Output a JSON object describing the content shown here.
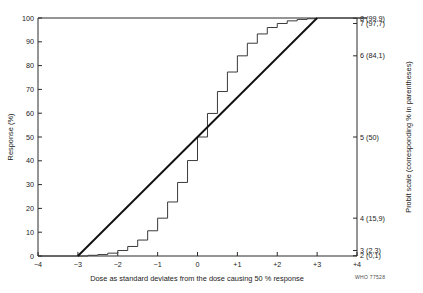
{
  "chart_data": {
    "type": "line",
    "title": "",
    "xlabel": "Dose as standard deviates from the dose causing 50 % response",
    "ylabel": "Response (%)",
    "y2label": "Probit scale (corresponding % in parentheses)",
    "xlim": [
      -4,
      4
    ],
    "ylim": [
      0,
      100
    ],
    "grid": false,
    "legend": "none",
    "credit": "WHO 77528",
    "xticks": [
      {
        "value": -4,
        "label": "−4"
      },
      {
        "value": -3,
        "label": "−3"
      },
      {
        "value": -2,
        "label": "−2"
      },
      {
        "value": -1,
        "label": "−1"
      },
      {
        "value": 0,
        "label": "0"
      },
      {
        "value": 1,
        "label": "+1"
      },
      {
        "value": 2,
        "label": "+2"
      },
      {
        "value": 3,
        "label": "+3"
      },
      {
        "value": 4,
        "label": "+4"
      }
    ],
    "yticks": [
      {
        "value": 0,
        "label": "0"
      },
      {
        "value": 10,
        "label": "10"
      },
      {
        "value": 20,
        "label": "20"
      },
      {
        "value": 30,
        "label": "30"
      },
      {
        "value": 40,
        "label": "40"
      },
      {
        "value": 50,
        "label": "50"
      },
      {
        "value": 60,
        "label": "60"
      },
      {
        "value": 70,
        "label": "70"
      },
      {
        "value": 80,
        "label": "80"
      },
      {
        "value": 90,
        "label": "90"
      },
      {
        "value": 100,
        "label": "100"
      }
    ],
    "y2ticks": [
      {
        "probit": 2,
        "percent": 0.1,
        "label": "2 (0,1)"
      },
      {
        "probit": 3,
        "percent": 2.3,
        "label": "3 (2,3)"
      },
      {
        "probit": 4,
        "percent": 15.9,
        "label": "4 (15,9)"
      },
      {
        "probit": 5,
        "percent": 50,
        "label": "5 (50)"
      },
      {
        "probit": 6,
        "percent": 84.1,
        "label": "6 (84,1)"
      },
      {
        "probit": 7,
        "percent": 97.7,
        "label": "7 (97,7)"
      },
      {
        "probit": 8,
        "percent": 99.9,
        "label": "8 (99,9)"
      }
    ],
    "series": [
      {
        "name": "Cumulative response ogive (staircase)",
        "type": "step",
        "step_width": 0.25,
        "x": [
          -3.0,
          -2.75,
          -2.5,
          -2.25,
          -2.0,
          -1.75,
          -1.5,
          -1.25,
          -1.0,
          -0.75,
          -0.5,
          -0.25,
          0.0,
          0.25,
          0.5,
          0.75,
          1.0,
          1.25,
          1.5,
          1.75,
          2.0,
          2.25,
          2.5,
          2.75,
          3.0,
          3.25,
          4.0
        ],
        "values": [
          0.0,
          0.3,
          0.6,
          1.2,
          2.3,
          4.0,
          6.7,
          10.6,
          15.9,
          22.7,
          30.9,
          40.1,
          50.0,
          59.9,
          69.1,
          77.3,
          84.1,
          89.4,
          93.3,
          96.0,
          97.7,
          98.8,
          99.4,
          99.7,
          100.0,
          100.0,
          100.0
        ]
      },
      {
        "name": "Probit regression line",
        "type": "line",
        "x": [
          -3,
          3
        ],
        "values": [
          0,
          100
        ]
      }
    ]
  }
}
